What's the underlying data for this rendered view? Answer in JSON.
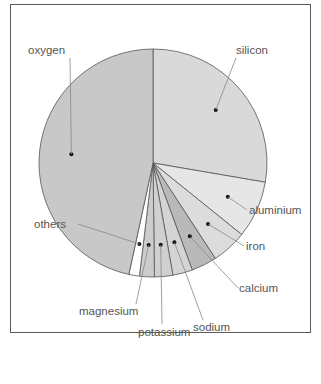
{
  "chart_data": {
    "type": "pie",
    "title": "",
    "categories": [
      "oxygen",
      "silicon",
      "aluminium",
      "iron",
      "calcium",
      "sodium",
      "potassium",
      "magnesium",
      "others"
    ],
    "values": [
      46.6,
      27.7,
      8.1,
      5.0,
      3.6,
      2.8,
      2.6,
      2.1,
      1.5
    ],
    "unit": "%",
    "legend": "labels with leader lines",
    "slice_colors": {
      "oxygen": "#c8c8c8",
      "silicon": "#d9d9d9",
      "aluminium": "#e6e6e6",
      "iron": "#dcdcdc",
      "calcium": "#b9b9b9",
      "sodium": "#d4d4d4",
      "potassium": "#d0d0d0",
      "magnesium": "#cccccc",
      "others": "#ffffff"
    }
  },
  "labels": {
    "oxygen": "oxygen",
    "silicon": "silicon",
    "aluminium": "aluminium",
    "iron": "iron",
    "calcium": "calcium",
    "sodium": "sodium",
    "potassium": "potassium",
    "magnesium": "magnesium",
    "others": "others"
  }
}
